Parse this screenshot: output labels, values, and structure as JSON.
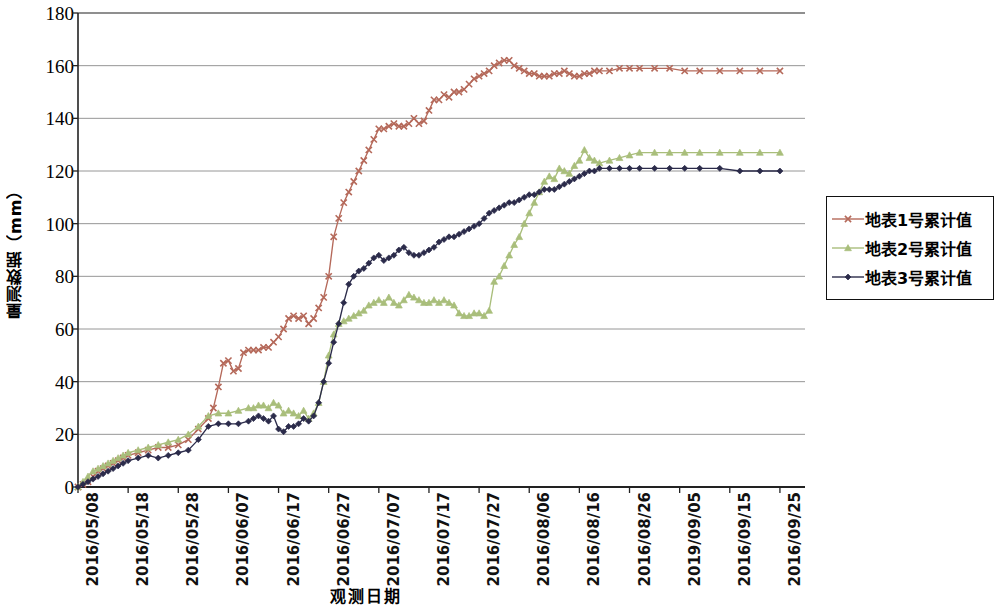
{
  "chart_data": {
    "type": "line",
    "title": "",
    "xlabel": "观测日期",
    "ylabel": "量测数据（mm）",
    "ylim": [
      0,
      180
    ],
    "ytick_values": [
      0,
      20,
      40,
      60,
      80,
      100,
      120,
      140,
      160,
      180
    ],
    "ytick_labels": [
      "0",
      "20",
      "40",
      "60",
      "80",
      "100",
      "120",
      "140",
      "160",
      "180"
    ],
    "grid": true,
    "grid_axis": "y",
    "legend_position": "right",
    "x_tick_labels": [
      "2016/05/08",
      "2016/05/18",
      "2016/05/28",
      "2016/06/07",
      "2016/06/17",
      "2016/06/27",
      "2016/07/07",
      "2016/07/17",
      "2016/07/27",
      "2016/08/06",
      "2016/08/16",
      "2016/08/26",
      "2019/09/05",
      "2016/09/15",
      "2016/09/25"
    ],
    "x_tick_day_index": [
      0,
      10,
      20,
      30,
      40,
      50,
      60,
      70,
      80,
      90,
      100,
      110,
      120,
      130,
      140
    ],
    "x_range_days": [
      0,
      145
    ],
    "series": [
      {
        "name": "地表1号累计值",
        "color": "#B5695A",
        "marker": "x",
        "x": [
          0,
          1,
          2,
          3,
          4,
          5,
          6,
          7,
          8,
          9,
          10,
          12,
          14,
          16,
          18,
          20,
          22,
          24,
          26,
          27,
          28,
          29,
          30,
          31,
          32,
          33,
          34,
          35,
          36,
          37,
          38,
          39,
          40,
          41,
          42,
          43,
          44,
          45,
          46,
          47,
          48,
          49,
          50,
          51,
          52,
          53,
          54,
          55,
          56,
          57,
          58,
          59,
          60,
          61,
          62,
          63,
          64,
          65,
          66,
          67,
          68,
          69,
          70,
          71,
          72,
          73,
          74,
          75,
          76,
          77,
          78,
          79,
          80,
          81,
          82,
          83,
          84,
          85,
          86,
          87,
          88,
          89,
          90,
          91,
          92,
          93,
          94,
          95,
          96,
          97,
          98,
          99,
          100,
          101,
          102,
          103,
          104,
          106,
          108,
          110,
          112,
          115,
          118,
          121,
          124,
          128,
          132,
          136,
          140
        ],
        "values": [
          0,
          1,
          2,
          4,
          6,
          7,
          8,
          9,
          10,
          11,
          12,
          13,
          14,
          15,
          15,
          16,
          18,
          22,
          26,
          30,
          38,
          47,
          48,
          44,
          45,
          51,
          52,
          52,
          52,
          53,
          53,
          55,
          57,
          60,
          64,
          65,
          64,
          65,
          62,
          64,
          68,
          72,
          80,
          95,
          102,
          108,
          112,
          116,
          120,
          124,
          128,
          132,
          136,
          136,
          137,
          138,
          137,
          137,
          138,
          140,
          138,
          139,
          143,
          147,
          147,
          149,
          148,
          150,
          150,
          151,
          153,
          155,
          156,
          157,
          158,
          160,
          161,
          162,
          162,
          160,
          159,
          158,
          157,
          157,
          156,
          156,
          156,
          157,
          157,
          158,
          157,
          156,
          156,
          157,
          157,
          158,
          158,
          158,
          159,
          159,
          159,
          159,
          159,
          158,
          158,
          158,
          158,
          158,
          158
        ]
      },
      {
        "name": "地表2号累计值",
        "color": "#A9BE7B",
        "marker": "triangle",
        "x": [
          0,
          1,
          2,
          3,
          4,
          5,
          6,
          7,
          8,
          9,
          10,
          12,
          14,
          16,
          18,
          20,
          22,
          24,
          26,
          28,
          30,
          32,
          34,
          35,
          36,
          37,
          38,
          39,
          40,
          41,
          42,
          43,
          44,
          45,
          46,
          47,
          48,
          49,
          50,
          51,
          52,
          53,
          54,
          55,
          56,
          57,
          58,
          59,
          60,
          61,
          62,
          63,
          64,
          65,
          66,
          67,
          68,
          69,
          70,
          71,
          72,
          73,
          74,
          75,
          76,
          77,
          78,
          79,
          80,
          81,
          82,
          83,
          84,
          85,
          86,
          87,
          88,
          89,
          90,
          91,
          92,
          93,
          94,
          95,
          96,
          97,
          98,
          99,
          100,
          101,
          102,
          103,
          104,
          106,
          108,
          110,
          112,
          115,
          118,
          121,
          124,
          128,
          132,
          136,
          140
        ],
        "values": [
          0,
          2,
          4,
          6,
          7,
          8,
          9,
          10,
          11,
          12,
          13,
          14,
          15,
          16,
          17,
          18,
          20,
          23,
          27,
          28,
          28,
          29,
          30,
          30,
          31,
          31,
          30,
          32,
          31,
          28,
          29,
          28,
          27,
          29,
          26,
          28,
          32,
          40,
          50,
          58,
          62,
          63,
          64,
          65,
          66,
          67,
          69,
          70,
          71,
          70,
          72,
          70,
          69,
          71,
          73,
          72,
          71,
          70,
          70,
          71,
          70,
          71,
          70,
          69,
          66,
          65,
          65,
          66,
          66,
          65,
          67,
          78,
          80,
          84,
          88,
          92,
          95,
          100,
          104,
          108,
          112,
          116,
          118,
          117,
          121,
          120,
          119,
          122,
          124,
          128,
          125,
          124,
          123,
          124,
          125,
          126,
          127,
          127,
          127,
          127,
          127,
          127,
          127,
          127,
          127
        ]
      },
      {
        "name": "地表3号累计值",
        "color": "#2B2B4A",
        "marker": "diamond",
        "x": [
          0,
          1,
          2,
          3,
          4,
          5,
          6,
          7,
          8,
          9,
          10,
          12,
          14,
          16,
          18,
          20,
          22,
          24,
          26,
          28,
          30,
          32,
          34,
          35,
          36,
          37,
          38,
          39,
          40,
          41,
          42,
          43,
          44,
          45,
          46,
          47,
          48,
          49,
          50,
          51,
          52,
          53,
          54,
          55,
          56,
          57,
          58,
          59,
          60,
          61,
          62,
          63,
          64,
          65,
          66,
          67,
          68,
          69,
          70,
          71,
          72,
          73,
          74,
          75,
          76,
          77,
          78,
          79,
          80,
          81,
          82,
          83,
          84,
          85,
          86,
          87,
          88,
          89,
          90,
          91,
          92,
          93,
          94,
          95,
          96,
          97,
          98,
          99,
          100,
          101,
          102,
          103,
          104,
          106,
          108,
          110,
          112,
          115,
          118,
          121,
          124,
          128,
          132,
          136,
          140
        ],
        "values": [
          0,
          1,
          2,
          3,
          4,
          5,
          6,
          7,
          8,
          9,
          10,
          11,
          12,
          11,
          12,
          13,
          14,
          18,
          23,
          24,
          24,
          24,
          25,
          26,
          27,
          26,
          25,
          27,
          22,
          21,
          23,
          23,
          24,
          26,
          25,
          27,
          32,
          40,
          47,
          55,
          62,
          70,
          77,
          80,
          82,
          83,
          85,
          87,
          88,
          86,
          87,
          88,
          90,
          91,
          89,
          88,
          88,
          89,
          90,
          91,
          93,
          94,
          95,
          95,
          96,
          97,
          98,
          99,
          100,
          102,
          104,
          105,
          106,
          107,
          108,
          108,
          109,
          110,
          111,
          111,
          112,
          113,
          113,
          113,
          114,
          115,
          116,
          117,
          118,
          119,
          120,
          120,
          121,
          121,
          121,
          121,
          121,
          121,
          121,
          121,
          121,
          121,
          120,
          120,
          120
        ]
      }
    ]
  },
  "legend": {
    "items": [
      {
        "label": "地表1号累计值",
        "color": "#B5695A",
        "marker": "x"
      },
      {
        "label": "地表2号累计值",
        "color": "#A9BE7B",
        "marker": "triangle"
      },
      {
        "label": "地表3号累计值",
        "color": "#2B2B4A",
        "marker": "diamond"
      }
    ]
  }
}
